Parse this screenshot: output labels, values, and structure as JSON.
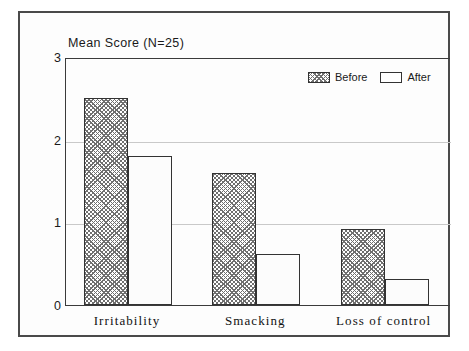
{
  "chart_data": {
    "type": "bar",
    "title": "Mean Score (N=25)",
    "xlabel": "",
    "ylabel": "Mean Score",
    "categories": [
      "Irritability",
      "Smacking",
      "Loss of control"
    ],
    "series": [
      {
        "name": "Before",
        "values": [
          2.5,
          1.6,
          0.92
        ]
      },
      {
        "name": "After",
        "values": [
          1.8,
          0.62,
          0.31
        ]
      }
    ],
    "ylim": [
      0,
      3
    ],
    "yticks": [
      0,
      1,
      2,
      3
    ],
    "ytick_labels": [
      "0",
      "1",
      "2",
      "3"
    ],
    "grid": true,
    "grid_axis": "y",
    "legend_position": "top-right",
    "annotations": [],
    "colors": {
      "before_fill": "#6f6f6f",
      "after_fill": "#fcfcfc",
      "bar_outline": "#333333",
      "axis": "#3b3b3b",
      "gridline": "#c9c9c9",
      "frame": "#4a4a4a",
      "text": "#1a1a1a",
      "background": "#ffffff"
    }
  },
  "legend": {
    "items": [
      {
        "label": "Before",
        "style": "hatched"
      },
      {
        "label": "After",
        "style": "empty"
      }
    ]
  }
}
